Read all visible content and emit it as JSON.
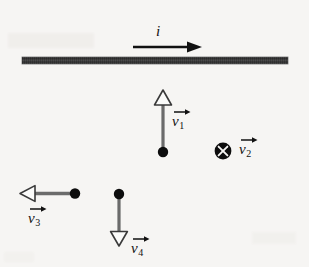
{
  "figure": {
    "background_color": "#f6f5f3",
    "ink_color": "#111111",
    "shaft_color": "#6b6b6b",
    "wire_color": "#707070"
  },
  "wire": {
    "name": "current-carrying-wire",
    "x_start": 22,
    "x_end": 288,
    "y_center": 61,
    "thickness": 7
  },
  "current": {
    "label": "i",
    "direction": "right",
    "arrow_x_start": 133,
    "arrow_x_end": 202,
    "arrow_y": 47,
    "label_x": 160,
    "label_y": 33
  },
  "vectors": [
    {
      "id": "v1",
      "label": "v",
      "subscript": "1",
      "direction": "up",
      "arrowhead": "hollow-triangle",
      "particle_x": 163,
      "particle_y": 152,
      "tip_x": 163,
      "tip_y": 90,
      "label_x": 175,
      "label_y": 115
    },
    {
      "id": "v2",
      "label": "v",
      "subscript": "2",
      "direction": "into-page",
      "symbol": "circle-x",
      "particle_x": 222,
      "particle_y": 150,
      "label_x": 242,
      "label_y": 145
    },
    {
      "id": "v3",
      "label": "v",
      "subscript": "3",
      "direction": "left",
      "arrowhead": "hollow-triangle",
      "particle_x": 75,
      "particle_y": 193,
      "tip_x": 20,
      "tip_y": 193,
      "label_x": 32,
      "label_y": 213
    },
    {
      "id": "v4",
      "label": "v",
      "subscript": "4",
      "direction": "down",
      "arrowhead": "hollow-triangle",
      "particle_x": 119,
      "particle_y": 194,
      "tip_x": 119,
      "tip_y": 246,
      "label_x": 134,
      "label_y": 243
    }
  ],
  "icons": {
    "current_arrow": "arrow-right-solid",
    "vector_accent": "arrow-right-accent",
    "into_page": "circle-x-icon",
    "particle": "filled-dot"
  }
}
